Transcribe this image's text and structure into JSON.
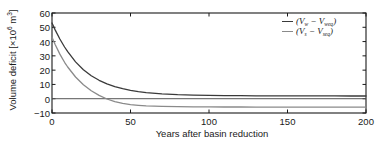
{
  "chart_data": {
    "type": "line",
    "title": "",
    "xlabel": "Years after basin reduction",
    "ylabel": "Volume deficit [×10⁶ m³]",
    "ylabel_text": "Volume deficit [×10",
    "ylabel_exp": "6",
    "ylabel_tail": " m",
    "ylabel_tail_exp": "3",
    "ylabel_close": "]",
    "xlim": [
      0,
      200
    ],
    "ylim": [
      -10,
      60
    ],
    "xticks": [
      0,
      50,
      100,
      150,
      200
    ],
    "xtick_labels": [
      "0",
      "50",
      "100",
      "150",
      "200"
    ],
    "yticks": [
      -10,
      0,
      10,
      20,
      30,
      40,
      50,
      60
    ],
    "ytick_labels": [
      "-10",
      "0",
      "10",
      "20",
      "30",
      "40",
      "50",
      "60"
    ],
    "grid": false,
    "frame": "box",
    "tick_direction": "in",
    "legend_position": "upper right",
    "zero_line": true,
    "series": [
      {
        "name": "(Vw - Vw_eq)",
        "label_main": "V",
        "label_main_sub": "w",
        "label_second": "V",
        "label_second_sub": "w",
        "label_second_subsub": "eq",
        "color": "#3a3a3a",
        "linewidth": 1.3,
        "x": [
          0,
          2,
          5,
          8,
          10,
          15,
          20,
          25,
          30,
          35,
          40,
          45,
          50,
          55,
          60,
          70,
          80,
          90,
          100,
          110,
          120,
          130,
          140,
          150,
          160,
          170,
          180,
          190,
          200
        ],
        "y": [
          53.0,
          48.2,
          41.8,
          36.2,
          32.9,
          25.8,
          20.3,
          16.1,
          12.9,
          10.4,
          8.5,
          7.0,
          5.9,
          5.0,
          4.3,
          3.4,
          2.8,
          2.5,
          2.3,
          2.2,
          2.1,
          2.05,
          2.0,
          2.0,
          2.0,
          1.95,
          1.95,
          1.9,
          1.9
        ],
        "asymptote": 2.0,
        "start_value": 53.0
      },
      {
        "name": "(Vs - Vs_eq)",
        "label_main": "V",
        "label_main_sub": "s",
        "label_second": "V",
        "label_second_sub": "s",
        "label_second_subsub": "eq",
        "color": "#8a8a8a",
        "linewidth": 1.3,
        "x": [
          0,
          2,
          5,
          8,
          10,
          15,
          20,
          25,
          30,
          35,
          40,
          45,
          50,
          55,
          60,
          70,
          80,
          90,
          100,
          110,
          120,
          130,
          140,
          150,
          160,
          170,
          180,
          190,
          200
        ],
        "y": [
          43.0,
          38.0,
          31.2,
          25.5,
          22.2,
          15.2,
          9.8,
          5.6,
          2.3,
          -0.2,
          -2.1,
          -3.3,
          -4.1,
          -4.6,
          -5.0,
          -5.4,
          -5.6,
          -5.7,
          -5.75,
          -5.8,
          -5.8,
          -5.85,
          -5.85,
          -5.9,
          -5.9,
          -5.9,
          -5.9,
          -5.95,
          -5.95
        ],
        "asymptote": -5.9,
        "start_value": 43.0,
        "zero_crossing_x": 33
      }
    ],
    "zero_line_color": "#555555"
  },
  "legend": {
    "entries": [
      {
        "text": "(Vw − Vweq)"
      },
      {
        "text": "(Vs − Vseq)"
      }
    ]
  },
  "colors": {
    "axis": "#1a1a1a",
    "series1": "#3a3a3a",
    "series2": "#8a8a8a",
    "background": "#ffffff"
  }
}
